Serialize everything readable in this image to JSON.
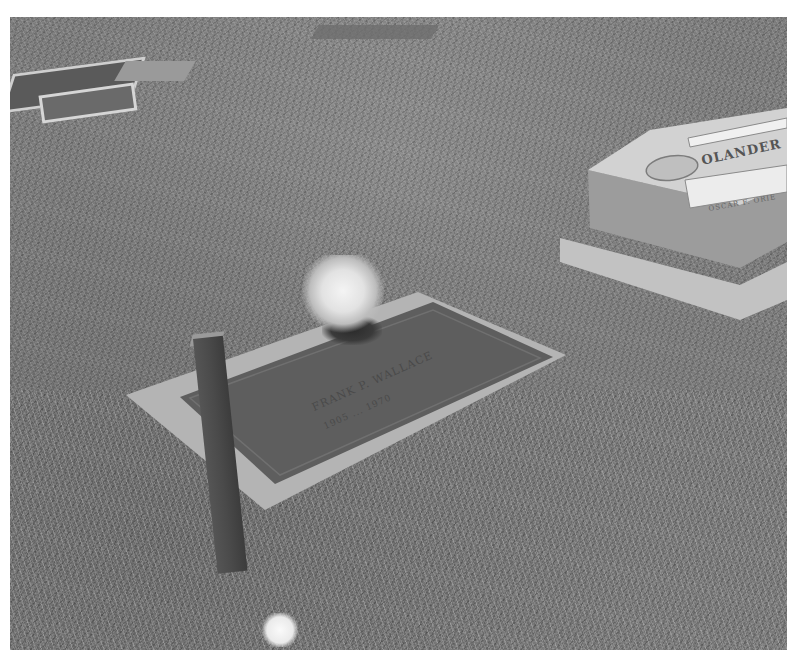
{
  "photo": {
    "description": "Grayscale photograph of a flat bronze grave marker in a grassy cemetery, with artificial flowers, a wooden stake in front, and a granite headstone at upper right",
    "mode": "grayscale"
  },
  "flat_marker": {
    "name_inscription": "FRANK P. WALLACE",
    "dates_inscription": "1905 ... 1970"
  },
  "headstone": {
    "family_name": "OLANDER",
    "panel_text": "OSCAR F. ORIE"
  },
  "colors": {
    "border": "#ffffff",
    "grass_mid": "#7c7c7c",
    "plaque": "#5e5e5e",
    "concrete": "#bcbcbc",
    "granite": "#c9c9c9"
  }
}
